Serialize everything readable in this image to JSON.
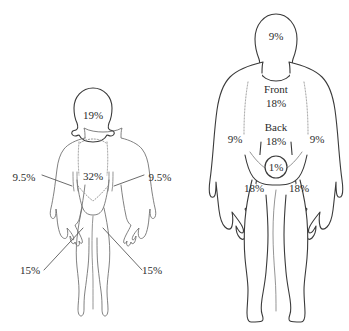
{
  "diagram": {
    "background_color": "#ffffff",
    "text_color": "#2b2b2b",
    "outline_color": "#3a3a3a"
  },
  "child": {
    "name": "child-figure",
    "labels": {
      "head": "19%",
      "trunk": "32%",
      "arm_left": "9.5%",
      "arm_right": "9.5%",
      "leg_left": "15%",
      "leg_right": "15%"
    }
  },
  "adult": {
    "name": "adult-figure",
    "labels": {
      "head": "9%",
      "front_title": "Front",
      "front_value": "18%",
      "back_title": "Back",
      "back_value": "18%",
      "arm_left": "9%",
      "arm_right": "9%",
      "groin": "1%",
      "leg_left": "18%",
      "leg_right": "18%"
    }
  }
}
